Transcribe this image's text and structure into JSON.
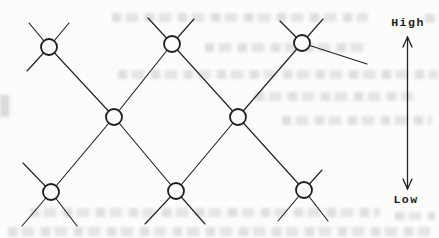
{
  "page": {
    "paper_color": "#fcfcfb",
    "ink_color": "#222220"
  },
  "diagram": {
    "type": "lattice-network",
    "node_radius": 8,
    "nodes": [
      {
        "id": "top-left",
        "x": 49,
        "y": 47
      },
      {
        "id": "top-middle",
        "x": 172,
        "y": 44
      },
      {
        "id": "top-right",
        "x": 302,
        "y": 43
      },
      {
        "id": "middle-left",
        "x": 114,
        "y": 117
      },
      {
        "id": "middle-right",
        "x": 238,
        "y": 117
      },
      {
        "id": "bottom-left",
        "x": 51,
        "y": 192
      },
      {
        "id": "bottom-middle",
        "x": 176,
        "y": 191
      },
      {
        "id": "bottom-right",
        "x": 304,
        "y": 190
      }
    ],
    "edges": [
      [
        "top-left",
        "middle-left"
      ],
      [
        "top-middle",
        "middle-left"
      ],
      [
        "top-middle",
        "middle-right"
      ],
      [
        "top-right",
        "middle-right"
      ],
      [
        "middle-left",
        "bottom-left"
      ],
      [
        "middle-left",
        "bottom-middle"
      ],
      [
        "middle-right",
        "bottom-middle"
      ],
      [
        "middle-right",
        "bottom-right"
      ]
    ],
    "stubs": [
      {
        "node": "top-left",
        "x": 29,
        "y": 23
      },
      {
        "node": "top-left",
        "x": 69,
        "y": 23
      },
      {
        "node": "top-left",
        "x": 27,
        "y": 71
      },
      {
        "node": "top-middle",
        "x": 148,
        "y": 18
      },
      {
        "node": "top-middle",
        "x": 194,
        "y": 19
      },
      {
        "node": "top-right",
        "x": 280,
        "y": 21
      },
      {
        "node": "top-right",
        "x": 323,
        "y": 19
      },
      {
        "node": "top-right",
        "x": 367,
        "y": 64
      },
      {
        "node": "bottom-left",
        "x": 23,
        "y": 163
      },
      {
        "node": "bottom-left",
        "x": 22,
        "y": 226
      },
      {
        "node": "bottom-left",
        "x": 77,
        "y": 226
      },
      {
        "node": "bottom-middle",
        "x": 145,
        "y": 224
      },
      {
        "node": "bottom-middle",
        "x": 205,
        "y": 224
      },
      {
        "node": "bottom-right",
        "x": 322,
        "y": 170
      },
      {
        "node": "bottom-right",
        "x": 278,
        "y": 221
      },
      {
        "node": "bottom-right",
        "x": 328,
        "y": 221
      }
    ],
    "scale": {
      "high_label": "High",
      "low_label": "Low",
      "arrow": {
        "x": 407.5,
        "top": 37,
        "bottom": 189,
        "head_len": 10,
        "head_halfwidth": 4.5
      }
    }
  }
}
